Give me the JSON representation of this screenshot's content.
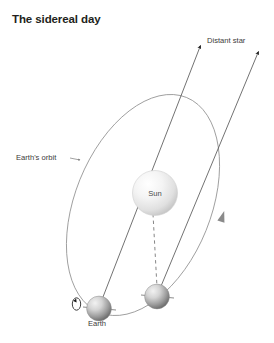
{
  "figure": {
    "title": "The sidereal day",
    "type": "astronomy-diagram",
    "background_color": "#ffffff",
    "width": 274,
    "height": 343
  },
  "labels": {
    "distant_star": "Distant star",
    "earths_orbit": "Earth's orbit",
    "sun": "Sun",
    "earth": "Earth"
  },
  "colors": {
    "text": "#231f20",
    "label_text": "#3b3b3b",
    "orbit_stroke": "#8c8c8c",
    "ray_stroke": "#5a5a5a",
    "dashed_stroke": "#6e6e6e",
    "sun_light": "#fdfdfd",
    "sun_dark": "#c8c8c8",
    "earth_light": "#e9e9e9",
    "earth_dark": "#6b6b6b",
    "arrow_fill": "#1a1a1a",
    "orbit_arrow_fill": "#7a7a7a"
  },
  "elements": {
    "orbit": {
      "name": "Earth's orbit",
      "shape": "ellipse",
      "center_x": 143,
      "center_y": 205,
      "radius_x": 68,
      "radius_y": 116,
      "rotation_deg": 22,
      "direction_marker": "counterclockwise-arrow-on-right-limb"
    },
    "sun": {
      "name": "Sun",
      "center_x": 155,
      "center_y": 193,
      "radius": 22
    },
    "earth_positions": [
      {
        "name": "Earth day 1",
        "center_x": 99,
        "center_y": 309,
        "radius": 12
      },
      {
        "name": "Earth day 2",
        "center_x": 157,
        "center_y": 297,
        "radius": 12
      }
    ],
    "star_rays": [
      {
        "from_x": 99,
        "from_y": 309,
        "to_x": 200,
        "to_y": 45
      },
      {
        "from_x": 157,
        "from_y": 297,
        "to_x": 258,
        "to_y": 51
      }
    ],
    "sun_earth_line": {
      "from_x": 155,
      "from_y": 215,
      "to_x": 157,
      "to_y": 285,
      "style": "dashed"
    },
    "rotation_marker": {
      "name": "Earth rotation arrow",
      "center_x": 76,
      "center_y": 303,
      "direction": "counterclockwise"
    },
    "orbit_label_pointer": {
      "from_x": 60,
      "from_y": 157,
      "to_x": 76,
      "to_y": 160
    }
  }
}
